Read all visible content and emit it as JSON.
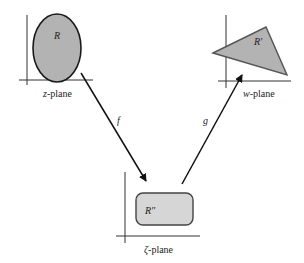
{
  "diagram": {
    "planes": {
      "z": {
        "label_var": "z",
        "label_suffix": "-plane",
        "region": "R",
        "shape": "ellipse"
      },
      "w": {
        "label_var": "w",
        "label_suffix": "-plane",
        "region": "R′",
        "shape": "triangle"
      },
      "zeta": {
        "label_var": "ζ",
        "label_suffix": "-plane",
        "region": "R″",
        "shape": "rounded-rectangle"
      }
    },
    "maps": {
      "f": {
        "label": "f",
        "from": "z-plane",
        "to": "ζ-plane"
      },
      "g": {
        "label": "g",
        "from": "ζ-plane",
        "to": "w-plane"
      }
    },
    "colors": {
      "region_fill": "#b3b3b3",
      "region_fill_light": "#d6d6d6",
      "stroke": "#222222",
      "triangle_stroke": "#555555"
    }
  }
}
